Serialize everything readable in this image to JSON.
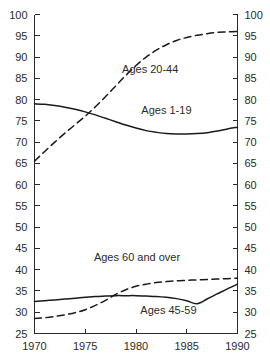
{
  "chart_data": {
    "type": "line",
    "title": "",
    "subtitle": "",
    "xlabel": "",
    "ylabel": "",
    "xlim": [
      1970,
      1990
    ],
    "ylim": [
      25,
      100
    ],
    "grid": false,
    "legend_position": "inline-annotations",
    "x_ticks": [
      1970,
      1975,
      1980,
      1985,
      1990
    ],
    "x_tick_labels": [
      "1970",
      "1975",
      "1980",
      "1985",
      "1990"
    ],
    "y_ticks": [
      25,
      30,
      35,
      40,
      45,
      50,
      55,
      60,
      65,
      70,
      75,
      80,
      85,
      90,
      95,
      100
    ],
    "y_tick_labels": [
      "25",
      "30",
      "35",
      "40",
      "45",
      "50",
      "55",
      "60",
      "65",
      "70",
      "75",
      "80",
      "85",
      "90",
      "95",
      "100"
    ],
    "y_axis_left": true,
    "y_axis_right": true,
    "series": [
      {
        "name": "Ages 1-19",
        "style": "solid",
        "color": "#1a1a1a",
        "label": "Ages 1-19",
        "label_x": 1983.0,
        "label_y": 76.6,
        "x": [
          1970,
          1971,
          1972,
          1973,
          1974,
          1975,
          1976,
          1977,
          1978,
          1979,
          1980,
          1981,
          1982,
          1983,
          1984,
          1985,
          1986,
          1987,
          1988,
          1989,
          1990
        ],
        "values": [
          79.0,
          78.9,
          78.6,
          78.2,
          77.7,
          77.1,
          76.4,
          75.6,
          74.8,
          74.0,
          73.3,
          72.7,
          72.3,
          72.0,
          71.9,
          71.9,
          72.0,
          72.2,
          72.6,
          73.1,
          73.5
        ]
      },
      {
        "name": "Ages 20-44",
        "style": "dashed",
        "color": "#1a1a1a",
        "label": "Ages 20-44",
        "label_x": 1981.4,
        "label_y": 86.3,
        "x": [
          1970,
          1971,
          1972,
          1973,
          1974,
          1975,
          1976,
          1977,
          1978,
          1979,
          1980,
          1981,
          1982,
          1983,
          1984,
          1985,
          1986,
          1987,
          1988,
          1989,
          1990
        ],
        "values": [
          65.5,
          67.8,
          70.0,
          72.1,
          74.1,
          76.1,
          78.3,
          80.7,
          83.2,
          85.7,
          88.0,
          90.0,
          91.6,
          92.9,
          93.9,
          94.6,
          95.1,
          95.5,
          95.8,
          95.9,
          96.0
        ]
      },
      {
        "name": "Ages 60 and over",
        "style": "dashed",
        "color": "#1a1a1a",
        "label": "Ages 60 and over",
        "label_x": 1980.1,
        "label_y": 42.0,
        "x": [
          1970,
          1971,
          1972,
          1973,
          1974,
          1975,
          1976,
          1977,
          1978,
          1979,
          1980,
          1981,
          1982,
          1983,
          1984,
          1985,
          1986,
          1987,
          1988,
          1989,
          1990
        ],
        "values": [
          28.5,
          28.7,
          29.0,
          29.4,
          29.9,
          30.6,
          31.6,
          32.8,
          34.2,
          35.3,
          36.1,
          36.6,
          37.0,
          37.2,
          37.4,
          37.5,
          37.6,
          37.7,
          37.8,
          37.9,
          38.0
        ]
      },
      {
        "name": "Ages 45-59",
        "style": "solid",
        "color": "#1a1a1a",
        "label": "Ages 45-59",
        "label_x": 1983.2,
        "label_y": 29.6,
        "x": [
          1970,
          1971,
          1972,
          1973,
          1974,
          1975,
          1976,
          1977,
          1978,
          1979,
          1980,
          1981,
          1982,
          1983,
          1984,
          1985,
          1986,
          1987,
          1988,
          1989,
          1990
        ],
        "values": [
          32.5,
          32.7,
          32.9,
          33.1,
          33.3,
          33.5,
          33.7,
          33.8,
          33.9,
          33.9,
          33.9,
          33.8,
          33.7,
          33.5,
          33.2,
          32.7,
          32.0,
          33.1,
          34.3,
          35.5,
          36.6
        ]
      }
    ]
  }
}
